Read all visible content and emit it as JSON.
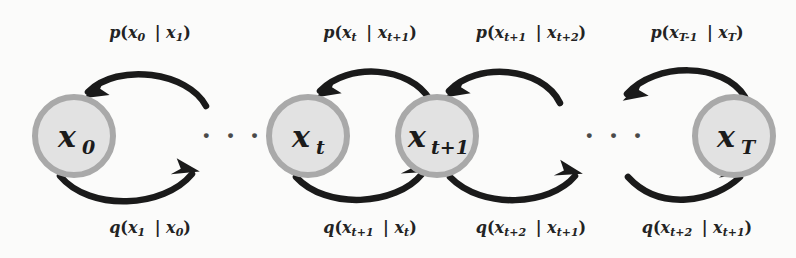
{
  "figure": {
    "type": "markov-chain-diagram",
    "background_color": "#fbfbfa",
    "node_fill_color": "#e2e2e2",
    "node_stroke_color": "#a8a8a8",
    "arrow_color": "#1a1a1a",
    "text_color": "#1b1b1b"
  },
  "nodes": [
    {
      "id": "x0",
      "base": "x",
      "sub": "0",
      "cx": 74,
      "cy": 136,
      "r": 42
    },
    {
      "id": "xt",
      "base": "x",
      "sub": "t",
      "cx": 308,
      "cy": 136,
      "r": 42
    },
    {
      "id": "xt1",
      "base": "x",
      "sub": "t+1",
      "cx": 437,
      "cy": 136,
      "r": 42
    },
    {
      "id": "xT",
      "base": "x",
      "sub": "T",
      "cx": 734,
      "cy": 136,
      "r": 42
    }
  ],
  "ellipses": [
    {
      "id": "ellipsis-left",
      "text": "· · ·",
      "x": 232,
      "y": 144
    },
    {
      "id": "ellipsis-right",
      "text": "· · ·",
      "x": 615,
      "y": 144
    }
  ],
  "top_labels": [
    {
      "id": "p-x0-x1",
      "fn": "p",
      "arg": "x",
      "arg_sub": "0",
      "given": "x",
      "given_sub": "1",
      "x": 150,
      "y": 38
    },
    {
      "id": "p-xt-xt1",
      "fn": "p",
      "arg": "x",
      "arg_sub": "t",
      "given": "x",
      "given_sub": "t+1",
      "x": 370,
      "y": 38
    },
    {
      "id": "p-xt1-xt2",
      "fn": "p",
      "arg": "x",
      "arg_sub": "t+1",
      "given": "x",
      "given_sub": "t+2",
      "x": 531,
      "y": 38
    },
    {
      "id": "p-xT1-xT",
      "fn": "p",
      "arg": "x",
      "arg_sub": "T-1",
      "given": "x",
      "given_sub": "T",
      "x": 697,
      "y": 38
    }
  ],
  "bottom_labels": [
    {
      "id": "q-x1-x0",
      "fn": "q",
      "arg": "x",
      "arg_sub": "1",
      "given": "x",
      "given_sub": "0",
      "x": 150,
      "y": 233
    },
    {
      "id": "q-xt1-xt",
      "fn": "q",
      "arg": "x",
      "arg_sub": "t+1",
      "given": "x",
      "given_sub": "t",
      "x": 370,
      "y": 233
    },
    {
      "id": "q-xt2-xt1",
      "fn": "q",
      "arg": "x",
      "arg_sub": "t+2",
      "given": "x",
      "given_sub": "t+1",
      "x": 531,
      "y": 233
    },
    {
      "id": "q-xt2-xt1-b",
      "fn": "q",
      "arg": "x",
      "arg_sub": "t+2",
      "given": "x",
      "given_sub": "t+1",
      "x": 697,
      "y": 233
    }
  ],
  "top_arcs": [
    {
      "id": "arc-p-0",
      "d": "M 206 106 C 188 72, 118 62, 86 93",
      "head": [
        86,
        93,
        -130
      ]
    },
    {
      "id": "arc-p-1",
      "d": "M 430 100 C 408 66, 345 62, 318 92",
      "head": [
        318,
        92,
        -132
      ]
    },
    {
      "id": "arc-p-2",
      "d": "M 560 103 C 540 66, 472 62, 446 92",
      "head": [
        446,
        92,
        -132
      ]
    },
    {
      "id": "arc-p-3",
      "d": "M 744 97 C 722 64, 653 64, 624 95",
      "head": [
        624,
        95,
        -133
      ]
    }
  ],
  "bottom_arcs": [
    {
      "id": "arc-q-0",
      "d": "M 62 177 C 92 210, 165 207, 194 172",
      "head": [
        194,
        172,
        -50
      ]
    },
    {
      "id": "arc-q-1",
      "d": "M 297 177 C 325 208, 394 206, 421 173",
      "head": [
        421,
        173,
        -50
      ]
    },
    {
      "id": "arc-q-2",
      "d": "M 451 177 C 482 209, 548 206, 573 175",
      "head": [
        573,
        175,
        -52
      ]
    },
    {
      "id": "arc-q-3",
      "d": "M 629 177 C 659 212, 712 201, 738 176",
      "head": [
        738,
        176,
        -48
      ]
    }
  ]
}
